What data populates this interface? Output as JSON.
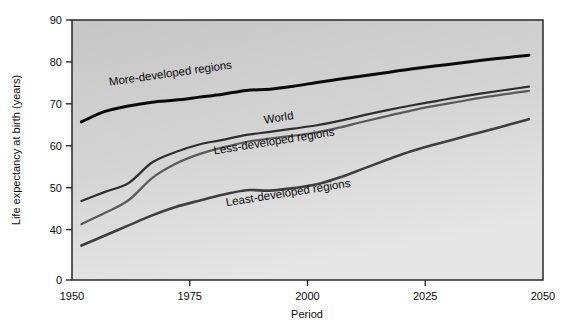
{
  "chart_data": {
    "type": "line",
    "title": "",
    "xlabel": "Period",
    "ylabel": "Life expectancy at birth (years)",
    "xlim": [
      1950,
      2050
    ],
    "ylim": [
      0,
      90
    ],
    "grid": false,
    "legend_position": "inline-labels",
    "xticks": [
      "1950",
      "1975",
      "2000",
      "2025",
      "2050"
    ],
    "xtick_values": [
      1950,
      1975,
      2000,
      2025,
      2050
    ],
    "yticks": [
      "0",
      "40",
      "50",
      "60",
      "70",
      "80",
      "90"
    ],
    "ytick_values": [
      0,
      40,
      50,
      60,
      70,
      80,
      90
    ],
    "y_axis_note": "Axis broken between 0 and 40",
    "x": [
      1952,
      1957,
      1962,
      1967,
      1972,
      1977,
      1982,
      1987,
      1992,
      1997,
      2002,
      2007,
      2012,
      2017,
      2022,
      2027,
      2032,
      2037,
      2042,
      2047
    ],
    "series": [
      {
        "name": "More-developed regions",
        "color": "#0a0a0a",
        "width": 3.0,
        "values": [
          65.7,
          68.2,
          69.5,
          70.4,
          70.9,
          71.6,
          72.3,
          73.2,
          73.5,
          74.2,
          75.1,
          75.9,
          76.7,
          77.5,
          78.3,
          79.0,
          79.7,
          80.4,
          81.0,
          81.6
        ]
      },
      {
        "name": "World",
        "color": "#2e2e2e",
        "width": 2.2,
        "values": [
          46.8,
          49.0,
          51.1,
          56.0,
          58.5,
          60.3,
          61.4,
          62.6,
          63.3,
          64.1,
          64.9,
          66.0,
          67.3,
          68.5,
          69.6,
          70.6,
          71.6,
          72.5,
          73.3,
          74.1
        ]
      },
      {
        "name": "Less-developed regions",
        "color": "#5a5a5a",
        "width": 2.2,
        "values": [
          41.3,
          44.0,
          47.0,
          52.3,
          55.7,
          58.0,
          59.6,
          60.9,
          61.7,
          62.4,
          63.2,
          64.4,
          65.8,
          67.1,
          68.4,
          69.5,
          70.5,
          71.5,
          72.3,
          73.1
        ]
      },
      {
        "name": "Least-developed regions",
        "color": "#3f3f3f",
        "width": 2.6,
        "values": [
          36.2,
          38.6,
          41.0,
          43.4,
          45.4,
          46.9,
          48.3,
          49.4,
          49.3,
          49.9,
          50.8,
          52.5,
          54.6,
          56.7,
          58.7,
          60.3,
          61.8,
          63.3,
          64.8,
          66.3
        ]
      }
    ],
    "annotations": [
      {
        "text": "More-developed regions",
        "x": 1971,
        "y": 76.4,
        "rotation": -8
      },
      {
        "text": "World",
        "x": 1994,
        "y": 65.8,
        "rotation": -9
      },
      {
        "text": "Less-developed regions",
        "x": 1993,
        "y": 60.2,
        "rotation": -9
      },
      {
        "text": "Least-developed regions",
        "x": 1996,
        "y": 47.9,
        "rotation": -9
      }
    ]
  },
  "plot": {
    "background_top": "#c9c9c9",
    "background_bottom": "#e3e3e3",
    "frame_color": "#1a1a1a",
    "page_background": "#ffffff"
  }
}
